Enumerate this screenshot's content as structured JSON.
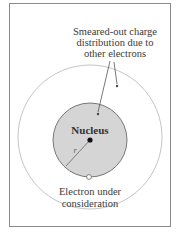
{
  "diagram": {
    "type": "atomic-shielding-illustration",
    "labels": {
      "smeared_line1": "Smeared-out charge",
      "smeared_line2": "distribution due to",
      "smeared_line3": "other electrons",
      "nucleus": "Nucleus",
      "radius": "r",
      "electron_line1": "Electron under",
      "electron_line2": "consideration"
    },
    "colors": {
      "frame": "#8a8a8a",
      "outer_circle": "#b8b8b8",
      "inner_fill": "#d4d4d4",
      "inner_stroke": "#6a6a6a",
      "text": "#3a3a3a",
      "nucleus_dot": "#111111"
    }
  }
}
